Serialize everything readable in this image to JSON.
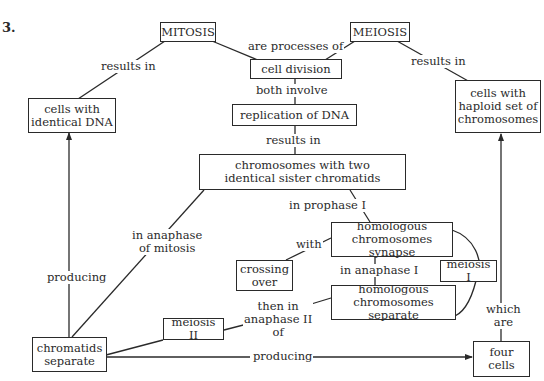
{
  "question_number": "3.",
  "top_fragment": "... , log ... o p ...",
  "nodes": {
    "mitosis": "MITOSIS",
    "meiosis": "MEIOSIS",
    "cell_division": "cell division",
    "cells_identical_dna": "cells with\nidentical DNA",
    "cells_haploid": "cells with\nhaploid set of\nchromosomes",
    "replication_dna": "replication of DNA",
    "chromosomes_two_chromatids": "chromosomes with two\nidentical sister chromatids",
    "homologous_synapse": "homologous\nchromosomes synapse",
    "crossing_over": "crossing\nover",
    "meiosis_1": "meiosis I",
    "homologous_separate": "homologous\nchromosomes separate",
    "meiosis_2": "meiosis II",
    "chromatids_separate": "chromatids\nseparate",
    "four_cells": "four\ncells"
  },
  "links": {
    "mitosis_results_in": "results in",
    "are_processes_of": "are processes of",
    "meiosis_results_in": "results in",
    "both_involve": "both involve",
    "replication_results_in": "results in",
    "in_prophase_1": "in prophase I",
    "in_anaphase_of_mitosis": "in anaphase\nof mitosis",
    "with": "with",
    "in_anaphase_1": "in anaphase I",
    "then_in_anaphase_2_of": "then in\nanaphase II\nof",
    "producing_up": "producing",
    "producing_right": "producing",
    "which_are": "which\nare"
  },
  "colors": {
    "line": "#2a2a2a",
    "background": "#ffffff"
  }
}
